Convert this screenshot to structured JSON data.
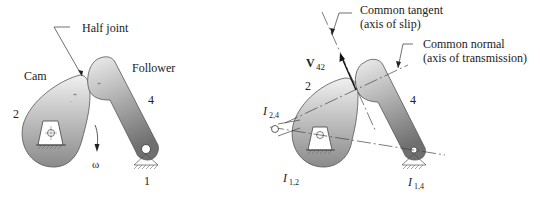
{
  "left_figure": {
    "labels": {
      "half_joint": "Half joint",
      "cam": "Cam",
      "follower": "Follower",
      "link2": "2",
      "link4": "4",
      "omega": "ω",
      "ground": "1"
    }
  },
  "right_figure": {
    "labels": {
      "tangent_line1": "Common tangent",
      "tangent_line2": "(axis of slip)",
      "normal_line1": "Common normal",
      "normal_line2": "(axis of transmission)",
      "velocity": "V",
      "velocity_sub": "42",
      "link2": "2",
      "link4": "4",
      "ic24": "I",
      "ic24_sub": "2,4",
      "ic12": "I",
      "ic12_sub": "1,2",
      "ic14": "I",
      "ic14_sub": "1,4"
    }
  },
  "colors": {
    "body_light": "#e8e8e8",
    "body_dark": "#8c8c8c",
    "outline": "#555555",
    "text": "#222222"
  }
}
